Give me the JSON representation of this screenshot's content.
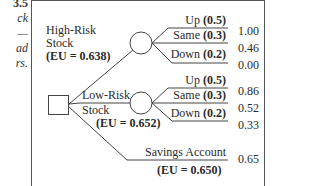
{
  "caption_fragment": {
    "lines": [
      "3.5",
      "ck",
      "—",
      "ad",
      "rs."
    ]
  },
  "tree": {
    "decision_node": {
      "shape": "square"
    },
    "options": [
      {
        "name_line1": "High-Risk",
        "name_line2": "Stock",
        "eu_label": "(EU = 0.638)",
        "outcomes": [
          {
            "label": "Up",
            "prob": "(0.5)",
            "value": "1.00"
          },
          {
            "label": "Same",
            "prob": "(0.3)",
            "value": "0.46"
          },
          {
            "label": "Down",
            "prob": "(0.2)",
            "value": "0.00"
          }
        ]
      },
      {
        "name_line1": "Low-Risk",
        "name_line2": "Stock",
        "eu_label": "(EU = 0.652)",
        "outcomes": [
          {
            "label": "Up",
            "prob": "(0.5)",
            "value": "0.86"
          },
          {
            "label": "Same",
            "prob": "(0.3)",
            "value": "0.52"
          },
          {
            "label": "Down",
            "prob": "(0.2)",
            "value": "0.33"
          }
        ]
      },
      {
        "name_line1": "Savings Account",
        "eu_label": "(EU = 0.650)",
        "value": "0.65"
      }
    ]
  }
}
